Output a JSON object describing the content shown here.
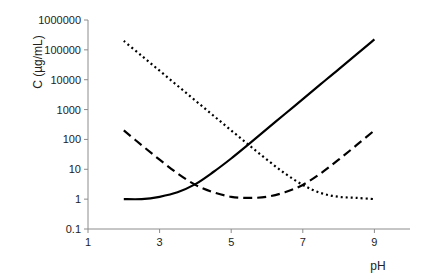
{
  "chart_data": {
    "type": "line",
    "title": "",
    "xlabel": "pH",
    "ylabel": "C (µg/mL)",
    "yscale": "log",
    "xlim": [
      1,
      10
    ],
    "ylim": [
      0.1,
      1000000
    ],
    "x_ticks": [
      1,
      3,
      5,
      7,
      9
    ],
    "x_tick_labels": [
      "1",
      "3",
      "5",
      "7",
      "9"
    ],
    "y_ticks": [
      0.1,
      1,
      10,
      100,
      1000,
      10000,
      100000,
      1000000
    ],
    "y_tick_labels": [
      "0.1",
      "1",
      "10",
      "100",
      "1000",
      "10000",
      "100000",
      "1000000"
    ],
    "grid": false,
    "legend": null,
    "x": [
      2,
      2.5,
      3,
      3.5,
      4,
      4.5,
      5,
      5.5,
      6,
      6.5,
      7,
      7.5,
      8,
      8.5,
      9
    ],
    "series": [
      {
        "name": "solid",
        "style": "solid",
        "color": "#000000",
        "values": [
          1.0,
          1.0,
          1.2,
          1.7,
          3.2,
          8.1,
          23,
          71,
          225,
          710,
          2240,
          7080,
          22400,
          70800,
          224000
        ]
      },
      {
        "name": "dashed",
        "style": "dashed",
        "color": "#000000",
        "values": [
          200,
          64,
          21,
          7.3,
          3.0,
          1.7,
          1.2,
          1.1,
          1.2,
          1.7,
          3.0,
          7.3,
          21,
          64,
          200
        ]
      },
      {
        "name": "dotted",
        "style": "dotted",
        "color": "#000000",
        "values": [
          200000,
          63100,
          20000,
          6310,
          2000,
          632,
          201,
          64,
          21,
          7.3,
          3.0,
          1.6,
          1.2,
          1.1,
          1.0
        ]
      }
    ]
  },
  "axes": {
    "x_title": "pH",
    "y_title": "C (µg/mL)",
    "colors": {
      "axis": "#8c8c8c",
      "line": "#000000",
      "text": "#222222"
    }
  }
}
